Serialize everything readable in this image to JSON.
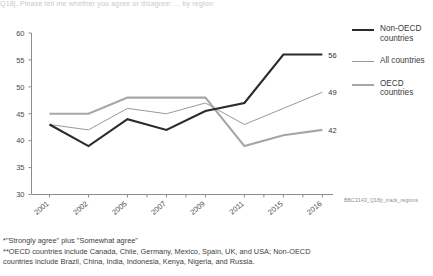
{
  "title_cut": "Q18j. Please tell me whether you agree or disagree: ... by region",
  "chart_data": {
    "type": "line",
    "title": "",
    "xlabel": "",
    "ylabel": "",
    "ylim": [
      30,
      60
    ],
    "yticks": [
      30,
      35,
      40,
      45,
      50,
      55,
      60
    ],
    "categories": [
      "2001",
      "2002",
      "2005",
      "2007",
      "2009",
      "2011",
      "2015",
      "2016"
    ],
    "grid": false,
    "legend_position": "right",
    "series": [
      {
        "name": "Non-OECD countries",
        "color": "#2b2b2b",
        "values": [
          43,
          39,
          44,
          42,
          45.5,
          47,
          56,
          56
        ],
        "end_label": "56"
      },
      {
        "name": "All countries",
        "color": "#9a9a9a",
        "values": [
          43,
          42,
          46,
          45,
          47,
          43,
          46,
          49
        ],
        "end_label": "49"
      },
      {
        "name": "OECD countries",
        "color": "#a6a6a6",
        "values": [
          45,
          45,
          48,
          48,
          48,
          39,
          41,
          42
        ],
        "end_label": "42"
      }
    ]
  },
  "legend": {
    "items": [
      {
        "label_line1": "Non-OECD",
        "label_line2": "countries",
        "swatch": "sw-nonoecd"
      },
      {
        "label_line1": "All countries",
        "label_line2": "",
        "swatch": "sw-all"
      },
      {
        "label_line1": "OECD",
        "label_line2": "countries",
        "swatch": "sw-oecd"
      }
    ]
  },
  "source_code": "BBC3143_Q18jt_track_regions",
  "footnotes": {
    "note1": "*\"Strongly agree\" plus \"Somewhat agree\"",
    "note2": "**OECD countries include Canada, Chile, Germany, Mexico, Spain, UK, and USA; Non-OECD countries include Brazil, China, India, Indonesia, Kenya, Nigeria, and Russia."
  }
}
